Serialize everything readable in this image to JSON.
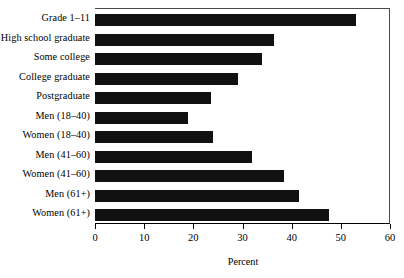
{
  "chart_data": {
    "type": "bar",
    "orientation": "horizontal",
    "title": "",
    "xlabel": "Percent",
    "ylabel": "",
    "xlim": [
      0,
      60
    ],
    "xticks": [
      0,
      10,
      20,
      30,
      40,
      50,
      60
    ],
    "xtick_labels": [
      "0",
      "10",
      "20",
      "30",
      "40",
      "50",
      "60"
    ],
    "grid": false,
    "legend": null,
    "bar_color": "#111111",
    "categories": [
      "Grade 1–11",
      "High school graduate",
      "Some college",
      "College graduate",
      "Postgraduate",
      "Men (18–40)",
      "Women (18–40)",
      "Men (41–60)",
      "Women (41–60)",
      "Men (61+)",
      "Women (61+)"
    ],
    "values": [
      53,
      36.5,
      34,
      29,
      23.5,
      19,
      24,
      32,
      38.5,
      41.5,
      47.5
    ]
  }
}
